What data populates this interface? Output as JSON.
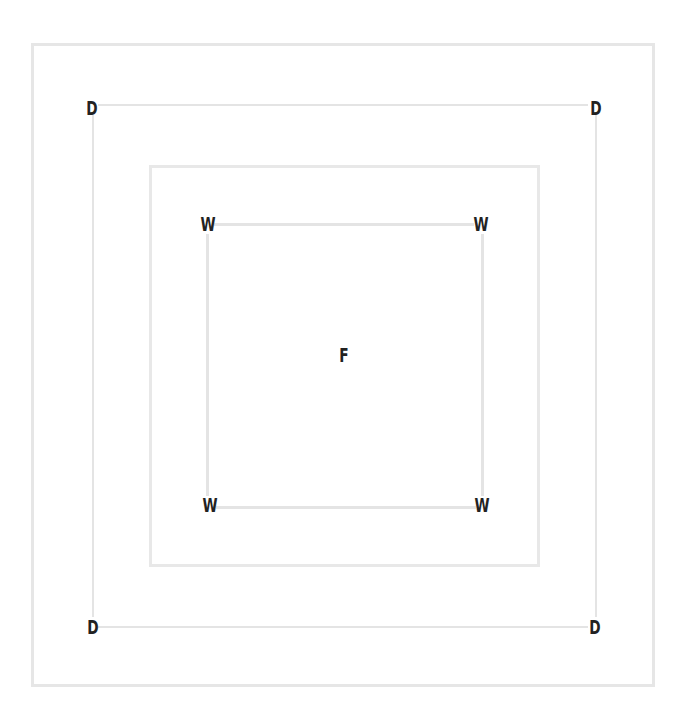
{
  "diagram": {
    "type": "nested-rectangles",
    "labels": {
      "d_top_left": "D",
      "d_top_right": "D",
      "d_bottom_left": "D",
      "d_bottom_right": "D",
      "w_top_left": "W",
      "w_top_right": "W",
      "w_bottom_left": "W",
      "w_bottom_right": "W",
      "center": "F"
    },
    "colors": {
      "line": "#e4e4e4",
      "label": "#222222",
      "background": "#ffffff"
    }
  }
}
